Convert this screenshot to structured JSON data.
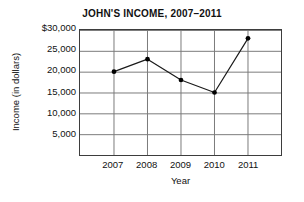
{
  "chart_data": {
    "type": "line",
    "title": "JOHN'S INCOME, 2007–2011",
    "xlabel": "Year",
    "ylabel": "Income (in dollars)",
    "categories": [
      "2007",
      "2008",
      "2009",
      "2010",
      "2011"
    ],
    "values": [
      20000,
      23000,
      18000,
      15000,
      28000
    ],
    "series": [
      {
        "name": "Income",
        "values": [
          20000,
          23000,
          18000,
          15000,
          28000
        ]
      }
    ],
    "ylim": [
      0,
      30000
    ],
    "ytick_values": [
      30000,
      25000,
      20000,
      15000,
      10000,
      5000
    ],
    "ytick_labels": [
      "$30,000",
      "25,000",
      "20,000",
      "15,000",
      "10,000",
      "5,000"
    ],
    "xtick_labels": [
      "2007",
      "2008",
      "2009",
      "2010",
      "2011"
    ],
    "grid": true,
    "grid_color": "#7a7a7a",
    "legend": "none",
    "line_color": "#1a1a1a",
    "marker": "circle",
    "marker_color": "#000000",
    "background_color": "#ffffff",
    "axis_color": "#3d3d3d"
  }
}
